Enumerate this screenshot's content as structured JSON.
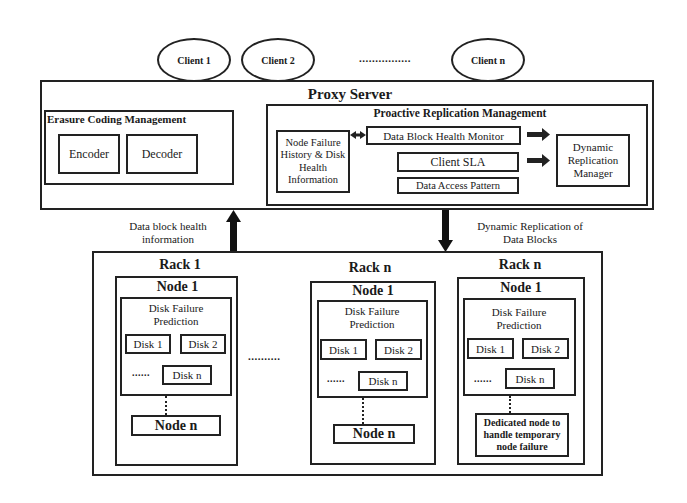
{
  "clients": {
    "items": [
      {
        "label": "Client 1"
      },
      {
        "label": "Client 2"
      },
      {
        "label": "Client n"
      }
    ],
    "ellipsis": "................"
  },
  "proxy": {
    "title": "Proxy Server",
    "erasure": {
      "title": "Erasure Coding Management",
      "encoder": "Encoder",
      "decoder": "Decoder"
    },
    "prm": {
      "title": "Proactive Replication Management",
      "history": "Node Failure History & Disk Health Information",
      "monitor": "Data Block Health Monitor",
      "sla": "Client SLA",
      "pattern": "Data Access Pattern",
      "manager": "Dynamic Replication Manager"
    }
  },
  "arrows": {
    "up_label": "Data block health information",
    "down_label": "Dynamic Replication of Data Blocks"
  },
  "racks": {
    "between_dots": "..........",
    "items": [
      {
        "title": "Rack 1",
        "node_title": "Node 1",
        "prediction": "Disk Failure Prediction",
        "disk1": "Disk 1",
        "disk2": "Disk 2",
        "diskn": "Disk n",
        "dots": "......",
        "last_node": "Node n"
      },
      {
        "title": "Rack n",
        "node_title": "Node 1",
        "prediction": "Disk Failure Prediction",
        "disk1": "Disk 1",
        "disk2": "Disk 2",
        "diskn": "Disk n",
        "dots": "......",
        "last_node": "Node n"
      },
      {
        "title": "Rack n",
        "node_title": "Node 1",
        "prediction": "Disk Failure Prediction",
        "disk1": "Disk 1",
        "disk2": "Disk 2",
        "diskn": "Disk n",
        "dots": "......",
        "last_node": "Dedicated node to handle temporary node failure"
      }
    ]
  }
}
